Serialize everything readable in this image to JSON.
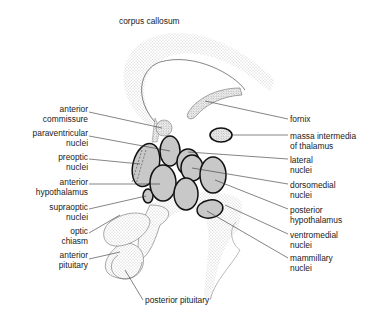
{
  "title": "corpus callosum",
  "colors": {
    "nucleus_fill": "#c8c8c8",
    "outline": "#222222",
    "stipple": "#9a9a9a",
    "background": "#ffffff"
  },
  "labels": {
    "corpus_callosum": "corpus callosum",
    "anterior_commissure": [
      "anterior",
      "commissure"
    ],
    "paraventricular_nuclei": [
      "paraventricular",
      "nuclei"
    ],
    "preoptic_nuclei": [
      "preoptic",
      "nuclei"
    ],
    "anterior_hypothalamus": [
      "anterior",
      "hypothalamus"
    ],
    "supraoptic_nuclei": [
      "supraoptic",
      "nuclei"
    ],
    "optic_chiasm": [
      "optic",
      "chiasm"
    ],
    "anterior_pituitary": [
      "anterior",
      "pituitary"
    ],
    "posterior_pituitary": "posterior pituitary",
    "fornix": "fornix",
    "massa_intermedia": [
      "massa intermedia",
      "of thalamus"
    ],
    "lateral_nuclei": [
      "lateral",
      "nuclei"
    ],
    "dorsomedial_nuclei": [
      "dorsomedial",
      "nuclei"
    ],
    "posterior_hypothalamus": [
      "posterior",
      "hypothalamus"
    ],
    "ventromedial_nuclei": [
      "ventromedial",
      "nuclei"
    ],
    "mammillary_nuclei": [
      "mammillary",
      "nuclei"
    ]
  }
}
